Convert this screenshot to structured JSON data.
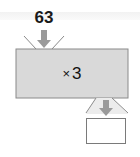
{
  "machine": {
    "input_value": "63",
    "operator_symbol": "×",
    "operand": "3",
    "output_value": ""
  },
  "colors": {
    "box_fill": "#d9d9d9",
    "arrow_fill": "#9a9a9a",
    "outline": "#8a8a8a"
  }
}
